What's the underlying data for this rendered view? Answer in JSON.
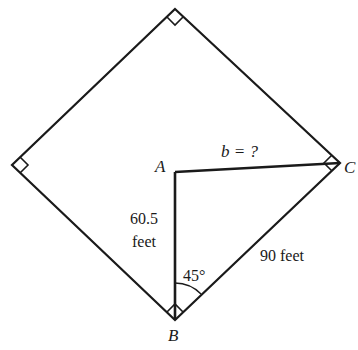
{
  "diagram": {
    "type": "geometry",
    "vertices": {
      "top": {
        "x": 175,
        "y": 9
      },
      "left": {
        "x": 12,
        "y": 165
      },
      "right_C": {
        "x": 340,
        "y": 163
      },
      "bottom_B": {
        "x": 175,
        "y": 320
      },
      "A": {
        "x": 175,
        "y": 172
      }
    },
    "labels": {
      "A": "A",
      "B": "B",
      "C": "C",
      "b_eq": "b = ?",
      "side_AB_value": "60.5",
      "side_AB_unit": "feet",
      "side_BC": "90 feet",
      "angle_B": "45°"
    },
    "right_angle_marks": [
      "top",
      "left",
      "right_C",
      "bottom_B"
    ],
    "colors": {
      "line": "#1a1a1a",
      "background": "#ffffff"
    }
  }
}
